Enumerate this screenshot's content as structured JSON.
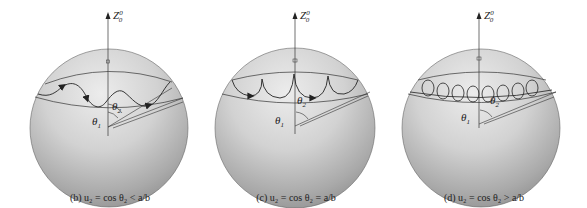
{
  "figure": {
    "panels": [
      {
        "id": "b",
        "center": [
          109,
          128
        ],
        "radius": 79,
        "axis_label": "Z",
        "axis_sup": "0",
        "axis_sub": "0",
        "theta1_label": "θ",
        "theta1_sub": "1",
        "theta2_label": "θ",
        "theta2_sub": "2",
        "trajectory": "wavy",
        "caption": "(b)  u₂ = cos θ₂ < a/b"
      },
      {
        "id": "c",
        "center": [
          295,
          128
        ],
        "radius": 80,
        "axis_label": "Z",
        "axis_sup": "0",
        "axis_sub": "0",
        "theta1_label": "θ",
        "theta1_sub": "1",
        "theta2_label": "θ",
        "theta2_sub": "2",
        "trajectory": "cusped",
        "caption": "(c)  u₂ = cos θ₂ = a/b"
      },
      {
        "id": "d",
        "center": [
          481,
          128
        ],
        "radius": 79,
        "axis_label": "Z",
        "axis_sup": "0",
        "axis_sub": "0",
        "theta1_label": "θ",
        "theta1_sub": "1",
        "theta2_label": "θ",
        "theta2_sub": "2",
        "trajectory": "looped",
        "caption": "(d)  u₂ = cos θ₂ > a/b"
      }
    ],
    "colors": {
      "background": "#ffffff",
      "sphere_light": "#e6e6e6",
      "sphere_mid": "#bdbdbd",
      "sphere_dark": "#8f8f8f",
      "line": "#2a2a2a"
    }
  }
}
